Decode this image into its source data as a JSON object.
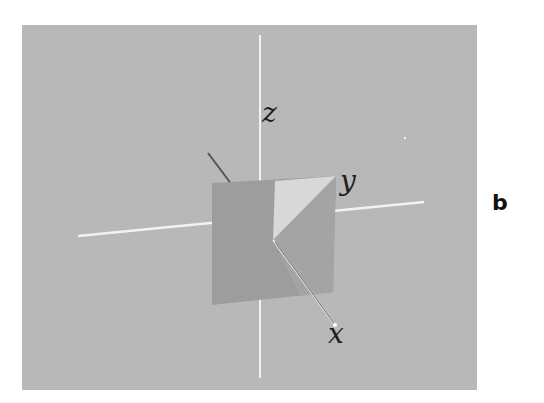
{
  "figure": {
    "panel_label": "b",
    "background_color": "#b8b8b8",
    "axes": {
      "x": {
        "label": "x"
      },
      "y": {
        "label": "y"
      },
      "z": {
        "label": "z"
      }
    },
    "colors": {
      "axis_line": "#f2f2f2",
      "back_axis_line": "#555555",
      "square": "#9d9d9d",
      "triangle_light": "#d8d8d8",
      "triangle_dark": "#a4a4a4"
    }
  }
}
